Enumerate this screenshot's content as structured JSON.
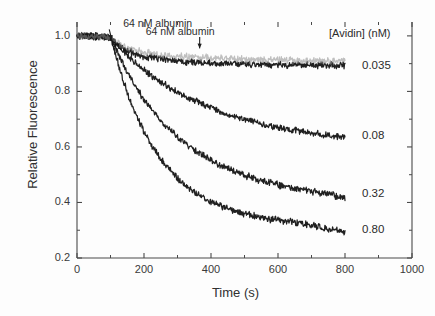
{
  "chart_data": {
    "type": "line",
    "title": "",
    "xlabel": "Time (s)",
    "ylabel": "Relative Fluorescence",
    "xlim": [
      0,
      1000
    ],
    "ylim": [
      0.2,
      1.05
    ],
    "x_ticks": [
      0,
      200,
      400,
      600,
      800,
      1000
    ],
    "y_ticks": [
      0.2,
      0.4,
      0.6,
      0.8,
      1.0
    ],
    "x_minor_step": 100,
    "y_minor_step": 0.1,
    "grid": false,
    "legend_position": "right-inside",
    "legend_title": "[Avidin] (nM)",
    "noise_amplitude": 0.009,
    "series": [
      {
        "name": "0.035",
        "label": "0.035",
        "color": "#141414",
        "baseline": 1.0,
        "t_start": 100,
        "plateau": 0.893,
        "rate_k": 0.013,
        "x": [
          0,
          25,
          50,
          75,
          100,
          125,
          150,
          175,
          200,
          250,
          300,
          350,
          400,
          450,
          500,
          550,
          600,
          650,
          700,
          750,
          800
        ],
        "y": [
          1.0,
          0.999,
          0.998,
          0.997,
          0.996,
          0.963,
          0.945,
          0.935,
          0.929,
          0.922,
          0.916,
          0.911,
          0.907,
          0.904,
          0.901,
          0.899,
          0.897,
          0.896,
          0.895,
          0.894,
          0.893
        ]
      },
      {
        "name": "0.08",
        "label": "0.08",
        "color": "#141414",
        "baseline": 1.0,
        "t_start": 100,
        "plateau": 0.6,
        "rate_k": 0.0038,
        "x": [
          0,
          25,
          50,
          75,
          100,
          150,
          200,
          250,
          300,
          350,
          400,
          450,
          500,
          550,
          600,
          650,
          700,
          750,
          800
        ],
        "y": [
          1.0,
          0.999,
          0.998,
          0.997,
          0.996,
          0.93,
          0.88,
          0.84,
          0.806,
          0.777,
          0.751,
          0.729,
          0.71,
          0.694,
          0.679,
          0.667,
          0.656,
          0.646,
          0.638
        ]
      },
      {
        "name": "0.32",
        "label": "0.32",
        "color": "#141414",
        "baseline": 1.0,
        "t_start": 100,
        "plateau": 0.385,
        "rate_k": 0.0058,
        "x": [
          0,
          25,
          50,
          75,
          100,
          150,
          200,
          250,
          300,
          350,
          400,
          450,
          500,
          550,
          600,
          650,
          700,
          750,
          800
        ],
        "y": [
          1.0,
          0.999,
          0.998,
          0.997,
          0.996,
          0.89,
          0.805,
          0.737,
          0.682,
          0.637,
          0.599,
          0.568,
          0.542,
          0.52,
          0.501,
          0.485,
          0.471,
          0.459,
          0.43
        ]
      },
      {
        "name": "0.80",
        "label": "0.80",
        "color": "#141414",
        "baseline": 1.0,
        "t_start": 100,
        "plateau": 0.285,
        "rate_k": 0.009,
        "x": [
          0,
          25,
          50,
          75,
          100,
          150,
          200,
          250,
          300,
          350,
          400,
          450,
          500,
          550,
          600,
          650,
          700,
          750,
          800
        ],
        "y": [
          1.0,
          0.999,
          0.998,
          0.997,
          0.996,
          0.84,
          0.718,
          0.625,
          0.554,
          0.5,
          0.459,
          0.427,
          0.403,
          0.385,
          0.371,
          0.36,
          0.342,
          0.32,
          0.3
        ]
      },
      {
        "name": "0.035-duplicate",
        "label": "",
        "color": "#8c8c8c",
        "baseline": 1.0,
        "t_start": 100,
        "plateau": 0.905,
        "rate_k": 0.0115,
        "x": [
          0,
          25,
          50,
          75,
          100,
          125,
          150,
          175,
          200,
          250,
          300,
          350,
          400,
          450,
          500,
          550,
          600,
          650,
          700,
          750,
          800
        ],
        "y": [
          1.0,
          0.999,
          0.998,
          0.997,
          0.996,
          0.972,
          0.958,
          0.95,
          0.946,
          0.941,
          0.937,
          0.934,
          0.932,
          0.928,
          0.924,
          0.921,
          0.918,
          0.916,
          0.914,
          0.912,
          0.91
        ]
      }
    ],
    "annotations": [
      {
        "text": "64 nM albumin",
        "label_x": 150,
        "label_y": 1.045,
        "tip_x": 104,
        "tip_y": 0.985
      },
      {
        "text": "64 nM albumin",
        "label_x": 420,
        "label_y": 1.018,
        "tip_x": 366,
        "tip_y": 0.955
      }
    ]
  },
  "axis": {
    "x_tick_labels": [
      "0",
      "200",
      "400",
      "600",
      "800",
      "1000"
    ],
    "y_tick_labels": [
      "0.2",
      "0.4",
      "0.6",
      "0.8",
      "1.0"
    ],
    "x_title": "Time (s)",
    "y_title": "Relative Fluorescence"
  },
  "legend": {
    "header": "[Avidin] (nM)",
    "entries": [
      {
        "label": "0.035",
        "y_value": 0.893
      },
      {
        "label": "0.08",
        "y_value": 0.638
      },
      {
        "label": "0.32",
        "y_value": 0.43
      },
      {
        "label": "0.80",
        "y_value": 0.3
      }
    ]
  }
}
